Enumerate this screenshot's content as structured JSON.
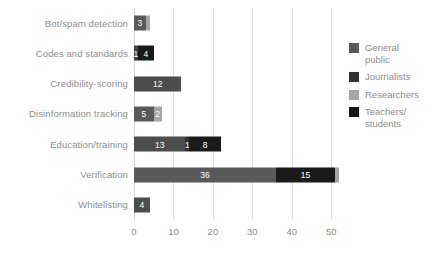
{
  "chart_data": {
    "type": "bar",
    "orientation": "horizontal",
    "stacked": true,
    "title": "",
    "subtitle": "",
    "xlabel": "",
    "ylabel": "",
    "xlim": [
      0,
      50.7
    ],
    "ylim": null,
    "grid": true,
    "grid_axis": "x",
    "legend_position": "right",
    "xticks": [
      0,
      10,
      20,
      30,
      40,
      50
    ],
    "xtick_labels": [
      "0",
      "10",
      "20",
      "30",
      "40",
      "50"
    ],
    "categories": [
      "Bot/spam detection",
      "Codes and standards",
      "Credibility-scoring",
      "Disinformation tracking",
      "Education/training",
      "Verification",
      "Whitelisting"
    ],
    "series": [
      {
        "name": "General public",
        "color": "#595959",
        "values": [
          3,
          0,
          12,
          5,
          13,
          36,
          4
        ]
      },
      {
        "name": "Journalists",
        "color": "#262626",
        "values": [
          0,
          1,
          0,
          0,
          0,
          15,
          0
        ]
      },
      {
        "name": "Researchers",
        "color": "#a6a6a6",
        "values": [
          1,
          0,
          0,
          2,
          1,
          1,
          0
        ]
      },
      {
        "name": "Teachers/students",
        "color": "#0d0d0d",
        "values": [
          0,
          4,
          0,
          0,
          8,
          0,
          0
        ]
      }
    ],
    "bar_segments": [
      {
        "category": "Bot/spam detection",
        "segments": [
          {
            "series": "General public",
            "value": 3,
            "label": "3",
            "color": "#595959",
            "show_label": true
          },
          {
            "series": "Researchers",
            "value": 1,
            "label": "1",
            "color": "#a6a6a6",
            "show_label": false
          }
        ],
        "total": 4
      },
      {
        "category": "Codes and standards",
        "segments": [
          {
            "series": "Journalists",
            "value": 1,
            "label": "1",
            "color": "#404040",
            "show_label": true
          },
          {
            "series": "Teachers/students",
            "value": 4,
            "label": "4",
            "color": "#1a1a1a",
            "show_label": true
          }
        ],
        "total": 5
      },
      {
        "category": "Credibility-scoring",
        "segments": [
          {
            "series": "General public",
            "value": 12,
            "label": "12",
            "color": "#4d4d4d",
            "show_label": true
          }
        ],
        "total": 12
      },
      {
        "category": "Disinformation tracking",
        "segments": [
          {
            "series": "General public",
            "value": 5,
            "label": "5",
            "color": "#595959",
            "show_label": true
          },
          {
            "series": "Researchers",
            "value": 2,
            "label": "2",
            "color": "#a6a6a6",
            "show_label": true
          }
        ],
        "total": 7
      },
      {
        "category": "Education/training",
        "segments": [
          {
            "series": "General public",
            "value": 13,
            "label": "13",
            "color": "#4d4d4d",
            "show_label": true
          },
          {
            "series": "Researchers",
            "value": 1,
            "label": "1",
            "color": "#333333",
            "show_label": true
          },
          {
            "series": "Teachers/students",
            "value": 8,
            "label": "8",
            "color": "#1a1a1a",
            "show_label": true
          }
        ],
        "total": 22
      },
      {
        "category": "Verification",
        "segments": [
          {
            "series": "General public",
            "value": 36,
            "label": "36",
            "color": "#595959",
            "show_label": true
          },
          {
            "series": "Journalists",
            "value": 15,
            "label": "15",
            "color": "#1a1a1a",
            "show_label": true
          },
          {
            "series": "Researchers",
            "value": 1,
            "label": "1",
            "color": "#a6a6a6",
            "show_label": false
          }
        ],
        "total": 52
      },
      {
        "category": "Whitelisting",
        "segments": [
          {
            "series": "General public",
            "value": 4,
            "label": "4",
            "color": "#4d4d4d",
            "show_label": true
          }
        ],
        "total": 4
      }
    ]
  },
  "legend": {
    "items": [
      {
        "label": "General\npublic",
        "color": "#595959"
      },
      {
        "label": "Journalists",
        "color": "#333333"
      },
      {
        "label": "Researchers",
        "color": "#a6a6a6"
      },
      {
        "label": "Teachers/\nstudents",
        "color": "#141414"
      }
    ]
  },
  "style": {
    "background": "#ffffff",
    "grid_color": "#dedede",
    "text_color": "#8d8d8d",
    "value_label_color": "#ffffff"
  }
}
